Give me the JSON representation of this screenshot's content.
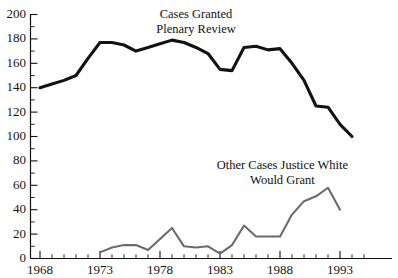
{
  "chart_data": {
    "type": "line",
    "title": "",
    "xlabel": "",
    "ylabel": "",
    "xlim": [
      1967,
      1995
    ],
    "ylim": [
      0,
      200
    ],
    "ytick_step": 20,
    "yminor_step": 10,
    "xtick_step": 5,
    "xminor_step": 1,
    "grid": false,
    "legend": "inline-annotations",
    "ytick_labels": [
      "0",
      "20",
      "40",
      "60",
      "80",
      "100",
      "120",
      "140",
      "160",
      "180",
      "200"
    ],
    "ytick_values": [
      0,
      20,
      40,
      60,
      80,
      100,
      120,
      140,
      160,
      180,
      200
    ],
    "xtick_labels": [
      "1968",
      "1973",
      "1978",
      "1983",
      "1988",
      "1993"
    ],
    "xtick_values": [
      1968,
      1973,
      1978,
      1983,
      1988,
      1993
    ],
    "series": [
      {
        "name": "Cases Granted Plenary Review",
        "color": "#121212",
        "x": [
          1968,
          1969,
          1970,
          1971,
          1972,
          1973,
          1974,
          1975,
          1976,
          1977,
          1978,
          1979,
          1980,
          1981,
          1982,
          1983,
          1984,
          1985,
          1986,
          1987,
          1988,
          1989,
          1990,
          1991,
          1992,
          1993,
          1994
        ],
        "values": [
          140,
          143,
          146,
          150,
          164,
          177,
          177,
          175,
          170,
          173,
          176,
          179,
          177,
          173,
          168,
          155,
          154,
          173,
          174,
          171,
          172,
          160,
          146,
          125,
          124,
          110,
          100
        ]
      },
      {
        "name": "Other Cases Justice White Would Grant",
        "color": "#6b6b6b",
        "x": [
          1973,
          1974,
          1975,
          1976,
          1977,
          1978,
          1979,
          1980,
          1981,
          1982,
          1983,
          1984,
          1985,
          1986,
          1987,
          1988,
          1989,
          1990,
          1991,
          1992,
          1993
        ],
        "values": [
          5,
          9,
          11,
          11,
          7,
          16,
          25,
          10,
          9,
          10,
          4,
          11,
          27,
          18,
          18,
          18,
          36,
          47,
          51,
          58,
          40
        ]
      }
    ],
    "annotations": [
      {
        "name": "top-series-label",
        "lines": [
          "Cases Granted",
          "Plenary Review"
        ],
        "x": 1981.0,
        "y": 197
      },
      {
        "name": "bottom-series-label",
        "lines": [
          "Other Cases Justice White",
          "Would Grant"
        ],
        "x": 1988.2,
        "y": 73
      }
    ]
  }
}
